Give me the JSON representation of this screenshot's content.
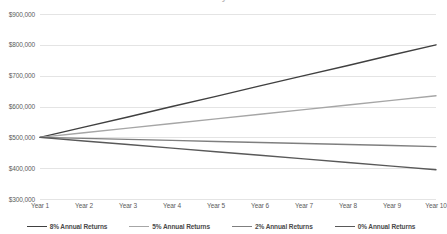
{
  "chart_data": {
    "type": "line",
    "title": "Investment Balance by Annual Return Rate",
    "xlabel": "",
    "ylabel": "",
    "x": [
      "Year 1",
      "Year 2",
      "Year 3",
      "Year 4",
      "Year 5",
      "Year 6",
      "Year 7",
      "Year 8",
      "Year 9",
      "Year 10"
    ],
    "categories": [
      "Year 1",
      "Year 2",
      "Year 3",
      "Year 4",
      "Year 5",
      "Year 6",
      "Year 7",
      "Year 8",
      "Year 9",
      "Year 10"
    ],
    "ylim": [
      300000,
      900000
    ],
    "ytick_values": [
      300000,
      400000,
      500000,
      600000,
      700000,
      800000,
      900000
    ],
    "ytick_labels": [
      "$300,000",
      "$400,000",
      "$500,000",
      "$600,000",
      "$700,000",
      "$800,000",
      "$900,000"
    ],
    "grid": true,
    "legend_position": "bottom",
    "series": [
      {
        "name": "8% Annual Returns",
        "color": "#404040",
        "values": [
          500000,
          533000,
          566000,
          600000,
          633000,
          667000,
          700000,
          733000,
          767000,
          800000
        ]
      },
      {
        "name": "5% Annual Returns",
        "color": "#a6a6a6",
        "values": [
          500000,
          515000,
          530000,
          545000,
          560000,
          575000,
          590000,
          605000,
          620000,
          635000
        ]
      },
      {
        "name": "2% Annual Returns",
        "color": "#7f7f7f",
        "values": [
          500000,
          496700,
          493300,
          490000,
          486700,
          483300,
          480000,
          476700,
          473300,
          470000
        ]
      },
      {
        "name": "0% Annual Returns",
        "color": "#595959",
        "values": [
          500000,
          488300,
          476700,
          465000,
          453300,
          441700,
          430000,
          418300,
          406700,
          395000
        ]
      }
    ]
  },
  "legend": {
    "items": [
      {
        "label": "8% Annual Returns"
      },
      {
        "label": "5% Annual Returns"
      },
      {
        "label": "2% Annual Returns"
      },
      {
        "label": "0% Annual Returns"
      }
    ]
  }
}
